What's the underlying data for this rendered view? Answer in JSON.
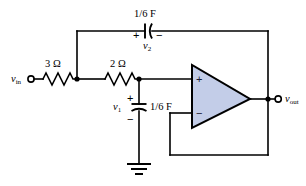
{
  "figure": {
    "background_color": "#ffffff",
    "wire_color": "#000000",
    "opamp_fill_color": "#c3cde8"
  },
  "terminals": {
    "input_label": "v",
    "input_sub": "in",
    "output_label": "v",
    "output_sub": "out"
  },
  "components": {
    "resistor_1": {
      "label": "3 Ω",
      "type": "resistor"
    },
    "resistor_2": {
      "label": "2 Ω",
      "type": "resistor"
    },
    "capacitor_top": {
      "label": "1/6 F",
      "type": "capacitor",
      "voltage_label": "v",
      "voltage_sub": "2",
      "plus_sign": "+",
      "minus_sign": "−"
    },
    "capacitor_bottom": {
      "label": "1/6 F",
      "type": "capacitor",
      "voltage_label": "v",
      "voltage_sub": "1",
      "plus_sign": "+",
      "minus_sign": "−"
    },
    "opamp": {
      "type": "operational-amplifier",
      "noninverting_sign": "+",
      "inverting_sign": "−"
    },
    "ground": {
      "type": "ground-symbol"
    }
  }
}
